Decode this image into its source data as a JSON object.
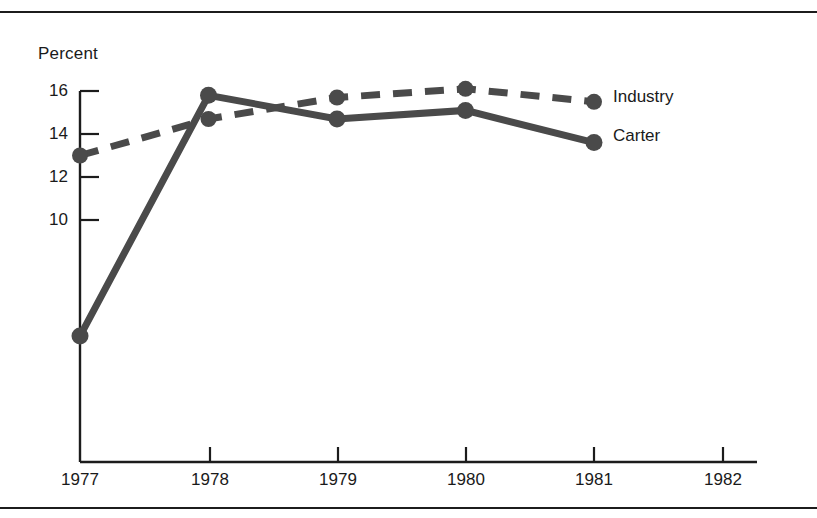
{
  "chart_data": {
    "type": "line",
    "title": "",
    "subtitle": "",
    "ylabel": "Percent",
    "xlabel": "",
    "categories": [
      "1977",
      "1978",
      "1979",
      "1980",
      "1981",
      "1982"
    ],
    "x": [
      1977,
      1978,
      1979,
      1980,
      1981,
      1982
    ],
    "xlim": [
      1977,
      1982
    ],
    "ylim": [
      4,
      16
    ],
    "yticks": [
      16,
      14,
      12,
      10
    ],
    "ytick_labels": [
      "16",
      "14",
      "12",
      "10"
    ],
    "xticks": [
      1977,
      1978,
      1979,
      1980,
      1981,
      1982
    ],
    "grid": false,
    "legend_position": "right-inline-end-of-series",
    "series": [
      {
        "name": "Industry",
        "style": "dashed",
        "marker": "filled-circle",
        "color": "#4a4a4a",
        "x": [
          1977,
          1978,
          1979,
          1980,
          1981
        ],
        "values": [
          13.0,
          14.7,
          15.7,
          16.1,
          15.5
        ]
      },
      {
        "name": "Carter",
        "style": "solid",
        "marker": "filled-circle",
        "color": "#4a4a4a",
        "x": [
          1977,
          1978,
          1979,
          1980,
          1981
        ],
        "values": [
          4.6,
          15.8,
          14.7,
          15.1,
          13.6
        ]
      }
    ],
    "annotations": []
  },
  "labels": {
    "axis_title": "Percent",
    "y": {
      "t16": "16",
      "t14": "14",
      "t12": "12",
      "t10": "10"
    },
    "x": {
      "y1977": "1977",
      "y1978": "1978",
      "y1979": "1979",
      "y1980": "1980",
      "y1981": "1981",
      "y1982": "1982"
    },
    "series": {
      "industry": "Industry",
      "carter": "Carter"
    }
  },
  "colors": {
    "ink": "#1c1c1c",
    "series": "#4a4a4a",
    "background": "#ffffff"
  }
}
